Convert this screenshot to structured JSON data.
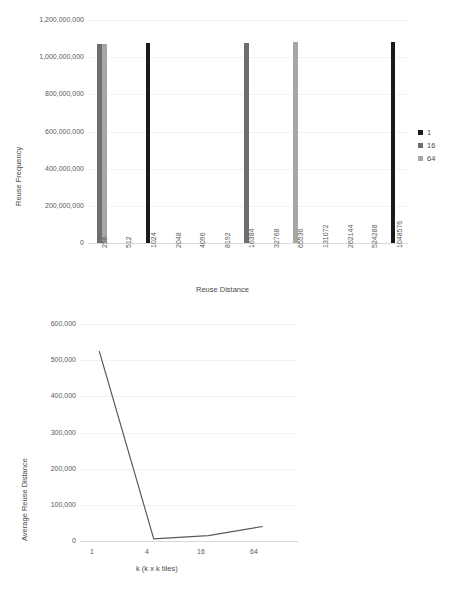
{
  "colors": {
    "series_1": "#1a1a1a",
    "series_16": "#6e6e6e",
    "series_64": "#a6a6a6",
    "line": "#595959",
    "gridline": "#f2f2f2",
    "axis": "#d9d9d9",
    "text": "#4a4a4a",
    "background": "#ffffff"
  },
  "chart_data": [
    {
      "id": "reuse-frequency",
      "type": "bar",
      "title": "",
      "xlabel": "Reuse Distance",
      "ylabel": "Reuse Frequency",
      "ylim": [
        0,
        1200000000
      ],
      "yticks": [
        "1,200,000,000",
        "1,000,000,000",
        "800,000,000",
        "600,000,000",
        "400,000,000",
        "200,000,000",
        "0"
      ],
      "ytick_values": [
        1200000000,
        1000000000,
        800000000,
        600000000,
        400000000,
        200000000,
        0
      ],
      "grid": true,
      "legend_position": "right",
      "categories": [
        "256",
        "512",
        "1024",
        "2048",
        "4096",
        "8192",
        "16384",
        "32768",
        "65536",
        "131072",
        "262144",
        "524288",
        "1048576"
      ],
      "series": [
        {
          "name": "1",
          "color": "#1a1a1a",
          "values": [
            0,
            0,
            1075000000,
            0,
            0,
            0,
            0,
            0,
            0,
            0,
            0,
            0,
            1080000000
          ]
        },
        {
          "name": "16",
          "color": "#6e6e6e",
          "values": [
            1072000000,
            0,
            0,
            0,
            0,
            0,
            1078000000,
            0,
            0,
            0,
            0,
            0,
            0
          ]
        },
        {
          "name": "64",
          "color": "#a6a6a6",
          "values": [
            1072000000,
            0,
            0,
            0,
            0,
            0,
            0,
            0,
            1080000000,
            0,
            0,
            0,
            0
          ]
        }
      ],
      "legend": [
        {
          "label": "1",
          "color": "#1a1a1a"
        },
        {
          "label": "16",
          "color": "#6e6e6e"
        },
        {
          "label": "64",
          "color": "#a6a6a6"
        }
      ]
    },
    {
      "id": "avg-reuse-distance",
      "type": "line",
      "title": "",
      "xlabel": "k (k x k tiles)",
      "ylabel": "Average Reuse Distance",
      "ylim": [
        0,
        600000
      ],
      "yticks": [
        "600,000",
        "500,000",
        "400,000",
        "300,000",
        "200,000",
        "100,000",
        "0"
      ],
      "ytick_values": [
        600000,
        500000,
        400000,
        300000,
        200000,
        100000,
        0
      ],
      "grid": true,
      "legend_position": "none",
      "categories": [
        "1",
        "4",
        "16",
        "64"
      ],
      "x": [
        1,
        4,
        16,
        64
      ],
      "values": [
        525000,
        6000,
        15000,
        40000
      ],
      "line_color": "#595959"
    }
  ]
}
